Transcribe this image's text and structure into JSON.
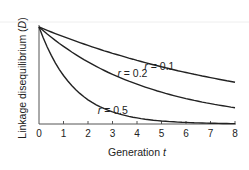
{
  "chart_data": {
    "type": "line",
    "title": "",
    "xlabel": "Generation t",
    "xlabel_parts": {
      "text": "Generation ",
      "var": "t"
    },
    "ylabel": "Linkage disequilibrium (D)",
    "ylabel_parts": {
      "text": "Linkage disequilibrium (",
      "var": "D",
      "close": ")"
    },
    "x": [
      0,
      1,
      2,
      3,
      4,
      5,
      6,
      7,
      8
    ],
    "xlim": [
      0,
      8
    ],
    "ylim": [
      0,
      1
    ],
    "xticks": [
      "0",
      "1",
      "2",
      "3",
      "4",
      "5",
      "6",
      "7",
      "8"
    ],
    "grid": false,
    "series": [
      {
        "name": "r = 0.1",
        "var": "r",
        "value": "0.1",
        "values": [
          1.0,
          0.9,
          0.81,
          0.729,
          0.656,
          0.59,
          0.531,
          0.478,
          0.43
        ]
      },
      {
        "name": "r = 0.2",
        "var": "r",
        "value": "0.2",
        "values": [
          1.0,
          0.8,
          0.64,
          0.512,
          0.41,
          0.328,
          0.262,
          0.21,
          0.168
        ]
      },
      {
        "name": "r = 0.5",
        "var": "r",
        "value": "0.5",
        "values": [
          1.0,
          0.5,
          0.25,
          0.125,
          0.0625,
          0.031,
          0.016,
          0.008,
          0.004
        ]
      }
    ],
    "annotations": [
      {
        "series": 0,
        "x": 4.3,
        "y": 0.56
      },
      {
        "series": 1,
        "x": 3.2,
        "y": 0.48
      },
      {
        "series": 2,
        "x": 2.4,
        "y": 0.1
      }
    ]
  },
  "colors": {
    "line": "#222222",
    "axis": "#555555"
  }
}
